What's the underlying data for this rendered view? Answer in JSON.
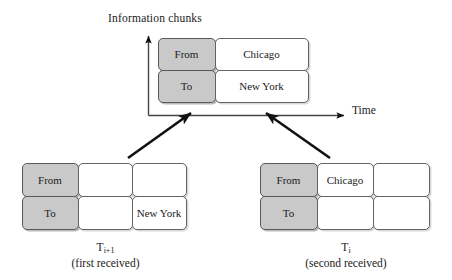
{
  "figure": {
    "vertical_axis_label": "Information chunks",
    "horizontal_axis_label": "Time"
  },
  "tables": {
    "merged": {
      "name": "merged-chunk-table",
      "rows": [
        {
          "label": "From",
          "values": [
            "Chicago"
          ]
        },
        {
          "label": "To",
          "values": [
            "New York"
          ]
        }
      ]
    },
    "left": {
      "name": "chunk-table-t-i-plus-1",
      "rows": [
        {
          "label": "From",
          "values": [
            "",
            ""
          ]
        },
        {
          "label": "To",
          "values": [
            "",
            "New York"
          ]
        }
      ],
      "caption_main": "T",
      "caption_sub": "i+1",
      "caption_note": "(first received)"
    },
    "right": {
      "name": "chunk-table-t-i",
      "rows": [
        {
          "label": "From",
          "values": [
            "Chicago",
            ""
          ]
        },
        {
          "label": "To",
          "values": [
            "",
            ""
          ]
        }
      ],
      "caption_main": "T",
      "caption_sub": "i",
      "caption_note": "(second received)"
    }
  },
  "colors": {
    "label_fill": "#c9c9c9",
    "cell_border": "#636363",
    "stroke": "#111111",
    "background": "#ffffff"
  }
}
